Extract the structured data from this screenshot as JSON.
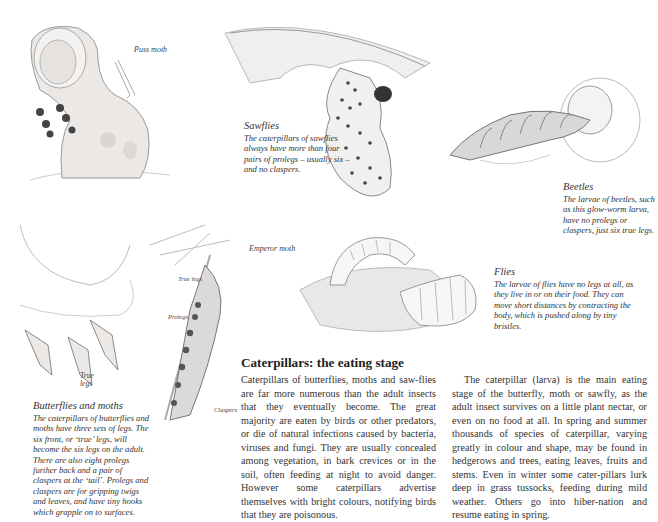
{
  "page": {
    "heading": "Caterpillars: the eating stage",
    "body_column_1": "Caterpillars of butterflies, moths and saw-flies are far more numerous than the adult insects that they eventually become. The great majority are eaten by birds or other predators, or die of natural infections caused by bacteria, viruses and fungi. They are usually concealed among vegetation, in bark crevices or in the soil, often feeding at night to avoid danger. However some caterpillars advertise themselves with bright colours, notifying birds that they are poisonous.",
    "body_column_2": "The caterpillar (larva) is the main eating stage of the butterfly, moth or sawfly, as the adult insect survives on a little plant nectar, or even on no food at all. In spring and summer thousands of species of caterpillar, varying greatly in colour and shape, may be found in hedgerows and trees, eating leaves, fruits and stems. Even in winter some cater-pillars lurk deep in grass tussocks, feeding during mild weather. Others go into hiber-nation and resume eating in spring."
  },
  "illustrations": {
    "puss_moth": {
      "label": "Puss moth"
    },
    "sawflies": {
      "title": "Sawflies",
      "caption": "The caterpillars of sawflies always have more than four pairs of prolegs – usually six – and no claspers."
    },
    "beetles": {
      "title": "Beetles",
      "caption": "The larvae of beetles, such as this glow-worm larva, have no prolegs or claspers, just six true legs."
    },
    "flies": {
      "title": "Flies",
      "caption": "The larvae of flies have no legs at all, as they live in or on their food. They can move short distances by contracting the body, which is pushed along by tiny bristles."
    },
    "emperor_moth": {
      "label": "Emperor moth"
    },
    "butterflies_and_moths": {
      "title": "Butterflies and moths",
      "caption": "The caterpillars of butterflies and moths have three sets of legs. The six front, or ‘true’ legs, will become the six legs on the adult. There are also eight prolegs further back and a pair of claspers at the ‘tail’. Prolegs and claspers are for gripping twigs and leaves, and have tiny hooks which grapple on to surfaces."
    },
    "anatomy_labels": {
      "true_legs_left": "True legs",
      "true_legs_stem": "True legs",
      "prolegs": "Prolegs",
      "claspers": "Claspers"
    }
  }
}
